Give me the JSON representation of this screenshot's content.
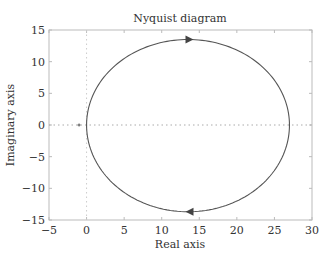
{
  "chart_data": {
    "type": "line",
    "title": "Nyquist diagram",
    "xlabel": "Real axis",
    "ylabel": "Imaginary axis",
    "xlim": [
      -5,
      30
    ],
    "ylim": [
      -15,
      15
    ],
    "xticks": [
      -5,
      0,
      5,
      10,
      15,
      20,
      25,
      30
    ],
    "yticks": [
      -15,
      -10,
      -5,
      0,
      5,
      10,
      15
    ],
    "xtick_labels": [
      "−5",
      "0",
      "5",
      "10",
      "15",
      "20",
      "25",
      "30"
    ],
    "ytick_labels": [
      "−15",
      "−10",
      "−5",
      "0",
      "5",
      "10",
      "15"
    ],
    "grid": false,
    "reference_lines": [
      {
        "orientation": "horizontal",
        "value": 0,
        "style": "dotted"
      },
      {
        "orientation": "vertical",
        "value": 0,
        "style": "dotted"
      }
    ],
    "critical_point": {
      "x": -1,
      "y": 0,
      "marker": "+"
    },
    "series": [
      {
        "name": "Nyquist curve",
        "shape": "circle",
        "center": [
          13.5,
          0
        ],
        "radius": 13.5,
        "x_range": [
          0,
          27
        ],
        "y_range": [
          -13.7,
          13.5
        ],
        "arrows": [
          {
            "x": 13.7,
            "y": 13.5,
            "direction": "right"
          },
          {
            "x": 13.7,
            "y": -13.7,
            "direction": "left"
          }
        ],
        "color": "#555555"
      }
    ],
    "legend": null
  }
}
